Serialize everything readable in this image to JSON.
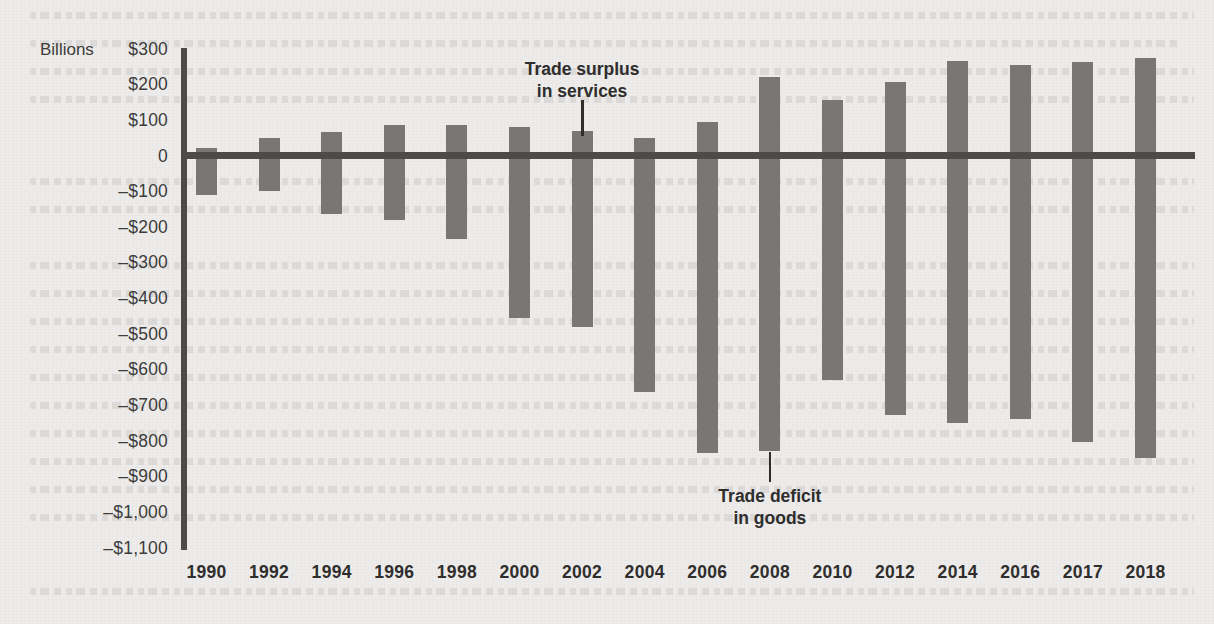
{
  "chart_data": {
    "type": "bar",
    "title": "",
    "subtitle": "",
    "xlabel": "",
    "ylabel": "Billions",
    "unit_label": "Billions",
    "grid": false,
    "legend_position": "none",
    "ylim": [
      -1100,
      300
    ],
    "ytick_step": 100,
    "ytick_labels": [
      "$300",
      "$200",
      "$100",
      "0",
      "–$100",
      "–$200",
      "–$300",
      "–$400",
      "–$500",
      "–$600",
      "–$700",
      "–$800",
      "–$900",
      "–$1,000",
      "–$1,100"
    ],
    "ytick_values": [
      300,
      200,
      100,
      0,
      -100,
      -200,
      -300,
      -400,
      -500,
      -600,
      -700,
      -800,
      -900,
      -1000,
      -1100
    ],
    "categories": [
      "1990",
      "1992",
      "1994",
      "1996",
      "1998",
      "2000",
      "2002",
      "2004",
      "2006",
      "2008",
      "2010",
      "2012",
      "2014",
      "2016",
      "2017",
      "2018"
    ],
    "series": [
      {
        "name": "Trade surplus in services",
        "values": [
          20,
          50,
          65,
          85,
          85,
          80,
          70,
          50,
          95,
          220,
          155,
          205,
          265,
          255,
          262,
          275
        ]
      },
      {
        "name": "Trade deficit in goods",
        "values": [
          -110,
          -100,
          -165,
          -180,
          -235,
          -455,
          -480,
          -665,
          -835,
          -830,
          -630,
          -728,
          -750,
          -740,
          -805,
          -850
        ]
      }
    ],
    "annotations": [
      {
        "id": "trade-surplus-in-services",
        "line1": "Trade surplus",
        "line2": "in services",
        "points_to_category": "2002",
        "points_to_series": "Trade surplus in services"
      },
      {
        "id": "trade-deficit-in-goods",
        "line1": "Trade deficit",
        "line2": "in goods",
        "points_to_category": "2008",
        "points_to_series": "Trade deficit in goods"
      }
    ],
    "colors": {
      "bar": "#797775",
      "axis": "#4c4b4a",
      "text": "#2f2e2d",
      "tick_text": "#3d3c3b",
      "background": "#edeceb"
    }
  }
}
